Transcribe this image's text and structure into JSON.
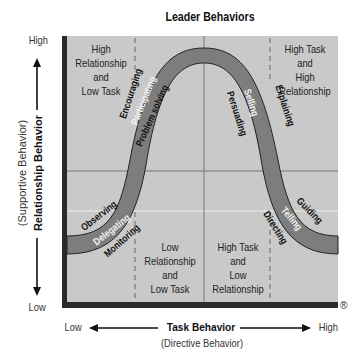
{
  "title": "Leader Behaviors",
  "y_axis": {
    "high": "High",
    "low": "Low",
    "label": "Relationship Behavior",
    "sublabel": "(Supportive Behavior)"
  },
  "x_axis": {
    "high": "High",
    "low": "Low",
    "label": "Task Behavior",
    "sublabel": "(Directive Behavior)"
  },
  "registered_mark": "®",
  "quadrants": {
    "top_left": [
      "High",
      "Relationship",
      "and",
      "Low Task"
    ],
    "top_right": [
      "High Task",
      "and",
      "High",
      "Relationship"
    ],
    "bottom_left": [
      "Low",
      "Relationship",
      "and",
      "Low Task"
    ],
    "bottom_right": [
      "High Task",
      "and",
      "Low",
      "Relationship"
    ]
  },
  "styles": {
    "delegating": {
      "band": "Delegating",
      "outer": "Observing",
      "inner": "Monitoring"
    },
    "participating": {
      "band": "Participating",
      "outer": "Encouraging",
      "inner": "Problem solving"
    },
    "selling": {
      "band": "Selling",
      "outer": "Explaining",
      "inner": "Persuading"
    },
    "telling": {
      "band": "Telling",
      "outer": "Guiding",
      "inner": "Directing"
    }
  },
  "colors": {
    "background": "#c9c9c9",
    "band": "#7d7d7d",
    "frame": "#2a2a2a",
    "grid": "#7a7a7a"
  }
}
